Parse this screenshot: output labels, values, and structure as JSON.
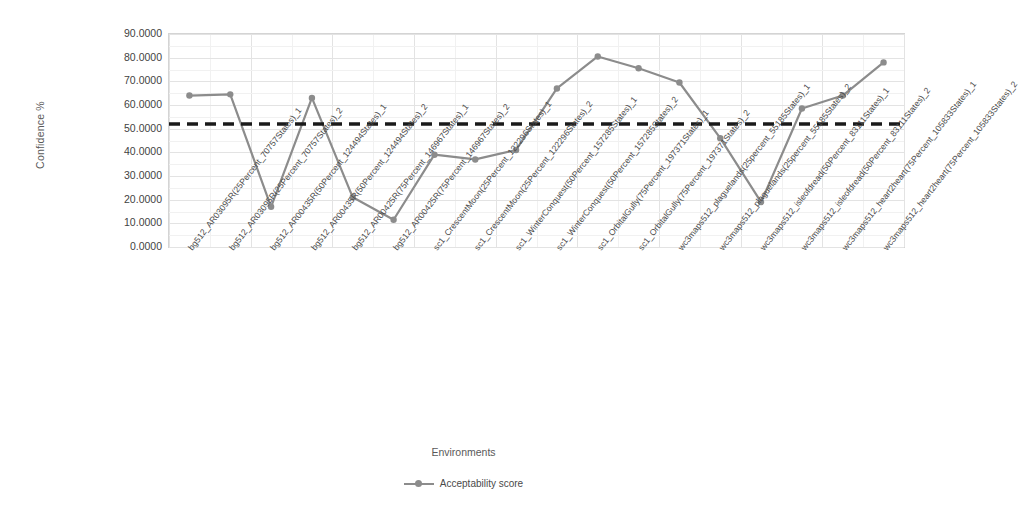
{
  "chart_data": {
    "type": "line",
    "title": "",
    "xlabel": "Environments",
    "ylabel": "Confidence %",
    "ylim": [
      0,
      90
    ],
    "ytick_labels": [
      "90.0000",
      "80.0000",
      "70.0000",
      "60.0000",
      "50.0000",
      "40.0000",
      "30.0000",
      "20.0000",
      "10.0000",
      "0.0000"
    ],
    "ytick_values": [
      90,
      80,
      70,
      60,
      50,
      40,
      30,
      20,
      10,
      0
    ],
    "grid": true,
    "legend_position": "bottom",
    "categories": [
      "bg512_AR03095R(25Percent_70757States)_1",
      "bg512_AR03095R(25Percent_70757States)_2",
      "bg512_AR00435R(50Percent_124494States)_1",
      "bg512_AR00425R(75Percent_146967States)_1",
      "bg512_AR00425R(75Percent_146967States)_2",
      "sc1_CrescentMoon(25Percent_122296States)_1",
      "sc1_CrescentMoon(25Percent_122296States)_2",
      "sc1_WinterConquest(50Percent_157285States)_1",
      "sc1_WinterConquest(50Percent_157285States)_2",
      "sc1_OrbitalGully(75Percent_197371States)_1",
      "sc1_OrbitalGully(75Percent_197371States)_2",
      "wc3maps512_plaguelands(25percent_55185States)_1",
      "wc3maps512_plaguelands(25percent_55185States)_2",
      "wc3maps512_isleofdread(50Percent_83111States)_1",
      "wc3maps512_isleofdread(50Percent_83111States)_2",
      "wc3maps512_heart2heart(75Percent_105833States)_1",
      "wc3maps512_heart2heart(75Percent_105833States)_2",
      "wc3maps512_heart2heart(75Percent_105833States)_2b"
    ],
    "categories_display": [
      "bg512_AR03095R(25Percent_70757States)_1",
      "bg512_AR03095R(25Percent_70757States)_2",
      "bg512_AR00435R(50Percent_124494States)_1",
      "bg512_AR00435R(50Percent_124494States)_2",
      "bg512_AR00425R(75Percent_146967States)_1",
      "bg512_AR00425R(75Percent_146967States)_2",
      "sc1_CrescentMoon(25Percent_122296States)_1",
      "sc1_CrescentMoon(25Percent_122296States)_2",
      "sc1_WinterConquest(50Percent_157285States)_1",
      "sc1_WinterConquest(50Percent_157285States)_2",
      "sc1_OrbitalGully(75Percent_197371States)_1",
      "sc1_OrbitalGully(75Percent_197371States)_2",
      "wc3maps512_plaguelands(25percent_55185States)_1",
      "wc3maps512_plaguelands(25percent_55185States)_2",
      "wc3maps512_isleofdread(50Percent_83111States)_1",
      "wc3maps512_isleofdread(50Percent_83111States)_2",
      "wc3maps512_heart2heart(75Percent_105833States)_1",
      "wc3maps512_heart2heart(75Percent_105833States)_2"
    ],
    "series": [
      {
        "name": "Acceptability score",
        "color": "#8c8c8c",
        "values": [
          64.0,
          64.5,
          17.0,
          63.0,
          21.0,
          11.5,
          39.0,
          37.0,
          41.0,
          67.0,
          80.5,
          75.5,
          69.5,
          46.0,
          19.0,
          58.5,
          64.0,
          78.0
        ]
      }
    ],
    "threshold_line": {
      "value": 52.0,
      "style": "dashed",
      "color": "#1a1a1a"
    }
  },
  "legend": {
    "entries": [
      {
        "label": "Acceptability score"
      }
    ]
  }
}
